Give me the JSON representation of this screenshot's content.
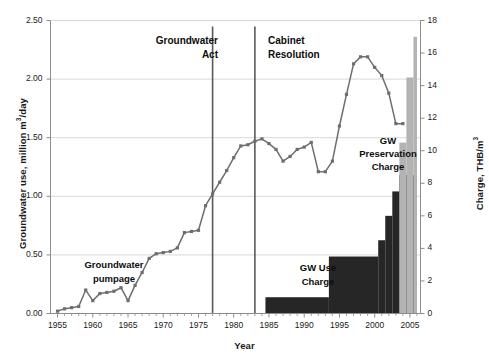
{
  "chart_data": {
    "type": "line",
    "title": "",
    "xlabel": "Year",
    "ylabel_left": "Groundwater use, million m3/day",
    "ylabel_right": "Charge, THB/m3",
    "xlim": [
      1954,
      2006.5
    ],
    "ylim_left": [
      0.0,
      2.5
    ],
    "ylim_right": [
      0,
      18
    ],
    "xticks": [
      1955,
      1960,
      1965,
      1970,
      1975,
      1980,
      1985,
      1990,
      1995,
      2000,
      2005
    ],
    "yticks_left": [
      "0.00",
      "0.50",
      "1.00",
      "1.50",
      "2.00",
      "2.50"
    ],
    "yticks_right": [
      "0",
      "2",
      "4",
      "6",
      "8",
      "10",
      "12",
      "14",
      "16",
      "18"
    ],
    "grid": "horizontal",
    "legend": "none",
    "series": [
      {
        "name": "Groundwater pumpage",
        "axis": "left",
        "type": "line",
        "color": "#6e6e6e",
        "x": [
          1955,
          1956,
          1957,
          1958,
          1959,
          1960,
          1961,
          1962,
          1963,
          1964,
          1965,
          1966,
          1967,
          1968,
          1969,
          1970,
          1971,
          1972,
          1973,
          1974,
          1975,
          1976,
          1977,
          1978,
          1979,
          1980,
          1981,
          1982,
          1983,
          1984,
          1985,
          1986,
          1987,
          1988,
          1989,
          1990,
          1991,
          1992,
          1993,
          1994,
          1995,
          1996,
          1997,
          1998,
          1999,
          2000,
          2001,
          2002,
          2003,
          2004
        ],
        "y": [
          0.02,
          0.04,
          0.05,
          0.06,
          0.2,
          0.11,
          0.17,
          0.18,
          0.19,
          0.22,
          0.11,
          0.24,
          0.35,
          0.47,
          0.51,
          0.52,
          0.53,
          0.56,
          0.69,
          0.7,
          0.71,
          0.92,
          1.02,
          1.12,
          1.22,
          1.33,
          1.43,
          1.44,
          1.47,
          1.49,
          1.45,
          1.4,
          1.3,
          1.34,
          1.4,
          1.42,
          1.46,
          1.21,
          1.21,
          1.3,
          1.6,
          1.87,
          2.13,
          2.19,
          2.19,
          2.1,
          2.03,
          1.88,
          1.62,
          1.62
        ]
      },
      {
        "name": "GW Use Charge",
        "axis": "right",
        "type": "step",
        "color": "#262626",
        "steps": [
          {
            "from": 1984.5,
            "to": 1993.5,
            "value": 1.0
          },
          {
            "from": 1993.5,
            "to": 2000.5,
            "value": 3.5
          },
          {
            "from": 2000.5,
            "to": 2001.5,
            "value": 4.5
          },
          {
            "from": 2001.5,
            "to": 2002.5,
            "value": 6.0
          },
          {
            "from": 2002.5,
            "to": 2003.5,
            "value": 7.5
          },
          {
            "from": 2003.5,
            "to": 2006.0,
            "value": 8.5
          }
        ]
      },
      {
        "name": "GW Preservation Charge",
        "axis": "right",
        "type": "step",
        "color": "#b3b3b3",
        "steps": [
          {
            "from": 2003.5,
            "to": 2004.5,
            "value": 10.5
          },
          {
            "from": 2004.5,
            "to": 2005.5,
            "value": 14.5
          },
          {
            "from": 2005.5,
            "to": 2006.0,
            "value": 17.0
          }
        ]
      }
    ],
    "annotations": [
      {
        "name": "Groundwater Act",
        "text": "Groundwater\nAct",
        "x": 1977,
        "line": true
      },
      {
        "name": "Cabinet Resolution",
        "text": "Cabinet\nResolution",
        "x": 1983,
        "line": true
      },
      {
        "name": "Groundwater pumpage",
        "text": "Groundwater\npumpage",
        "line": false
      },
      {
        "name": "GW Use Charge",
        "text": "GW Use\nCharge",
        "line": false
      },
      {
        "name": "GW Preservation Charge",
        "text": "GW\nPreservation\nCharge",
        "line": false
      }
    ]
  },
  "axes": {
    "xlabel": "Year",
    "ytick_labels_left": [
      "2.50",
      "2.00",
      "1.50",
      "1.00",
      "0.50",
      "0.00"
    ],
    "ytick_labels_right": [
      "18",
      "16",
      "14",
      "12",
      "10",
      "8",
      "6",
      "4",
      "2",
      "0"
    ],
    "xtick_labels": [
      "1955",
      "1960",
      "1965",
      "1970",
      "1975",
      "1980",
      "1985",
      "1990",
      "1995",
      "2000",
      "2005"
    ]
  },
  "annotations": {
    "gw_act": "Groundwater\nAct",
    "cabinet_resolution": "Cabinet\nResolution",
    "groundwater_pumpage": "Groundwater\npumpage",
    "gw_use_charge": "GW Use\nCharge",
    "gw_preservation_charge": "GW\nPreservation\nCharge"
  },
  "colors": {
    "line": "#6e6e6e",
    "use_charge": "#262626",
    "preservation_charge": "#b3b3b3",
    "grid": "#d4d4d4",
    "axis": "#8c8c8c",
    "text": "#1a1a1a"
  }
}
